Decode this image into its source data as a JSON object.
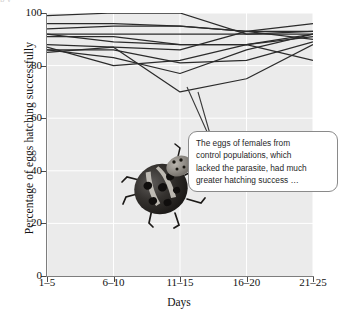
{
  "figure": {
    "title_sliver": "p y",
    "background": "#ffffff",
    "plot_background": "#ebebeb",
    "grid_color": "#ffffff",
    "line_color": "#2b2b2b",
    "axis_color": "#7d7d7d"
  },
  "annotation": {
    "name": "callout",
    "text": "The eggs of females from control populations, which lacked the parasite, had much greater hatching success …",
    "lines": [
      "The eggs of females from",
      "control populations, which",
      "lacked the parasite, had much",
      "greater hatching success …"
    ],
    "points_to_series": "series-10",
    "points_to_category": "11–15",
    "points_to_value": 70
  },
  "image": {
    "name": "ladybug-photo",
    "caption": "ladybird beetle (ladybug)"
  },
  "chart_data": {
    "type": "line",
    "title": "",
    "xlabel": "Days",
    "ylabel": "Percentage of eggs hatching successfully",
    "categories": [
      "1–5",
      "6–10",
      "11–15",
      "16–20",
      "21–25"
    ],
    "ylim": [
      0,
      100
    ],
    "yticks": [
      0,
      20,
      40,
      60,
      80,
      100
    ],
    "grid": true,
    "legend": "none",
    "series": [
      {
        "name": "series-1",
        "values": [
          99,
          100,
          100,
          92,
          93
        ]
      },
      {
        "name": "series-2",
        "values": [
          96,
          96,
          95,
          93,
          96
        ]
      },
      {
        "name": "series-3",
        "values": [
          94,
          95,
          95,
          93,
          93
        ]
      },
      {
        "name": "series-4",
        "values": [
          92,
          92,
          92,
          92,
          92
        ]
      },
      {
        "name": "series-5",
        "values": [
          92,
          89,
          88,
          88,
          92
        ]
      },
      {
        "name": "series-6",
        "values": [
          91,
          91,
          88,
          88,
          91
        ]
      },
      {
        "name": "series-7",
        "values": [
          88,
          87,
          86,
          93,
          90
        ]
      },
      {
        "name": "series-8",
        "values": [
          87,
          80,
          82,
          88,
          82
        ]
      },
      {
        "name": "series-9",
        "values": [
          86,
          86,
          81,
          82,
          89
        ]
      },
      {
        "name": "series-10",
        "values": [
          85,
          87,
          70,
          75,
          88
        ]
      },
      {
        "name": "series-11",
        "values": [
          86,
          83,
          77,
          86,
          92
        ]
      }
    ]
  }
}
